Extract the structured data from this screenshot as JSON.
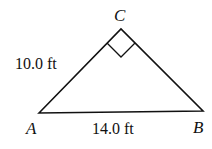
{
  "figure": {
    "type": "right-triangle",
    "vertices": {
      "A": {
        "label": "A",
        "x": 39,
        "y": 113
      },
      "B": {
        "label": "B",
        "x": 203,
        "y": 111
      },
      "C": {
        "label": "C",
        "x": 121,
        "y": 29
      }
    },
    "right_angle_at": "C",
    "sides": {
      "AC": {
        "label": "10.0 ft"
      },
      "AB": {
        "label": "14.0 ft"
      }
    },
    "colors": {
      "stroke": "#111111",
      "background": "#ffffff"
    }
  }
}
